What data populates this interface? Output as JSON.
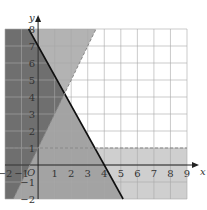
{
  "chart_data": {
    "type": "region",
    "title": "",
    "xlabel": "x",
    "ylabel": "y",
    "xlim": [
      -2,
      9
    ],
    "ylim": [
      -2,
      8
    ],
    "grid": true,
    "origin_label": "O",
    "x_ticks": [
      "-2",
      "-1",
      "1",
      "2",
      "3",
      "4",
      "5",
      "6",
      "7",
      "8",
      "9"
    ],
    "y_ticks": [
      "-2",
      "-1",
      "1",
      "2",
      "3",
      "4",
      "5",
      "6",
      "7",
      "8"
    ],
    "lines": [
      {
        "name": "y = 7 - 1.75x",
        "style": "solid",
        "color": "#111111",
        "points": [
          [
            -0.57,
            8
          ],
          [
            4,
            0
          ],
          [
            5.14,
            -2
          ]
        ]
      },
      {
        "name": "y = 2x + 1",
        "style": "dashed",
        "color": "#888888",
        "points": [
          [
            -1.5,
            -2
          ],
          [
            0,
            1
          ],
          [
            3.5,
            8
          ]
        ]
      },
      {
        "name": "y = 1",
        "style": "dashed",
        "color": "#888888",
        "points": [
          [
            -2,
            1
          ],
          [
            9,
            1
          ]
        ]
      }
    ],
    "shaded_regions": [
      {
        "name": "left of y=2x+1",
        "shade": "#aaaaaa"
      },
      {
        "name": "below y=7-1.75x",
        "shade": "#999999"
      },
      {
        "name": "below y=1",
        "shade": "#cccccc"
      }
    ]
  }
}
